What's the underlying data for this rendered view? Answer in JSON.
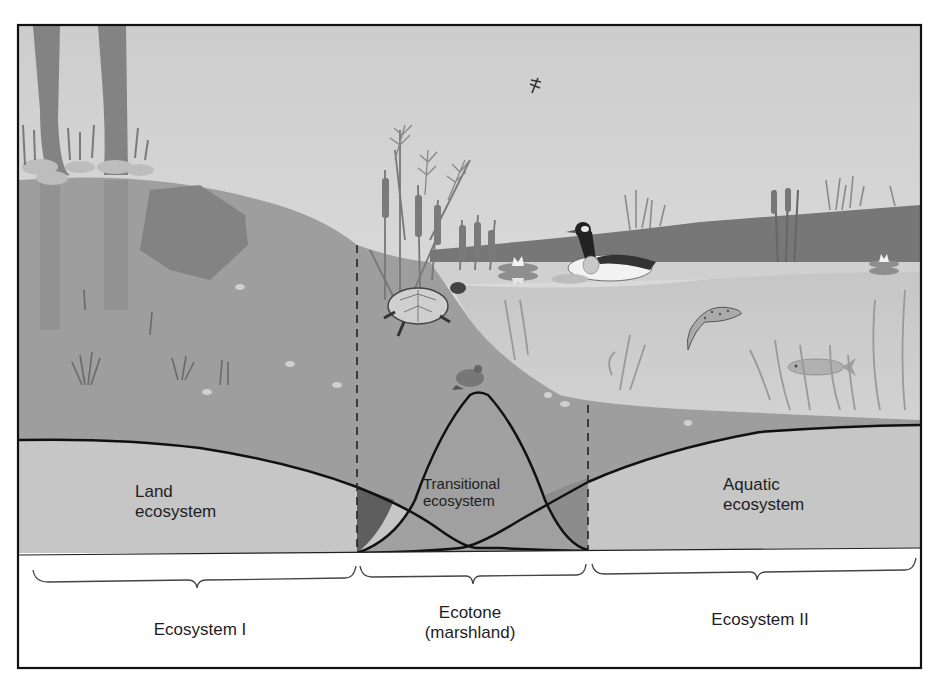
{
  "figure": {
    "graph_labels": {
      "land": [
        "Land",
        "ecosystem"
      ],
      "transitional": [
        "Transitional",
        "ecosystem"
      ],
      "aquatic": [
        "Aquatic",
        "ecosystem"
      ]
    },
    "zones": [
      {
        "id": "ecosystem-1",
        "lines": [
          "Ecosystem I"
        ]
      },
      {
        "id": "ecotone",
        "lines": [
          "Ecotone",
          "(marshland)"
        ]
      },
      {
        "id": "ecosystem-2",
        "lines": [
          "Ecosystem II"
        ]
      }
    ],
    "scene_elements": [
      "trees",
      "rocks",
      "shrub",
      "grass",
      "cattails",
      "turtle",
      "frog",
      "dragonfly",
      "duck",
      "water-lilies",
      "trout",
      "fish",
      "water-plants",
      "far-shore"
    ],
    "colors": {
      "sky": "#d4d4d4",
      "land": "#9c9c9c",
      "land_dark": "#7e7e7e",
      "water_surface": "#c8c8c8",
      "water_deep": "#bdbdbd",
      "far_shore": "#767676",
      "graph_fill": "#c2c2c2",
      "overlap_dark": "#5a5a5a",
      "overlap_mid": "#8a8a8a",
      "line": "#111111",
      "panel": "#ffffff"
    }
  }
}
